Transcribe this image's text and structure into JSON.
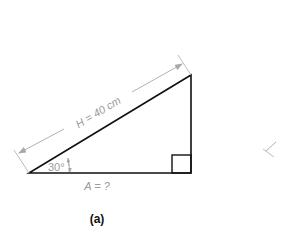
{
  "figure": {
    "caption": "(a)",
    "hypotenuse_label": "H = 40 cm",
    "angle_label": "30°",
    "base_label": "A = ?"
  },
  "colors": {
    "shape_stroke": "#111111",
    "dimension_stroke": "#a8a8a8",
    "dimension_text": "#9a9a9a"
  }
}
